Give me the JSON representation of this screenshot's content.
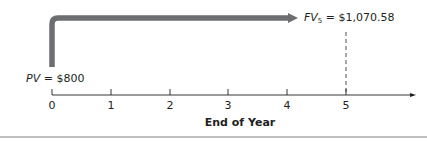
{
  "diagram": {
    "type": "timeline",
    "present_value": {
      "symbol": "PV",
      "equals": "=",
      "value": "$800"
    },
    "future_value": {
      "symbol": "FV",
      "subscript": "5",
      "equals": "=",
      "value": "$1,070.58"
    },
    "axis": {
      "ticks": [
        "0",
        "1",
        "2",
        "3",
        "4",
        "5"
      ],
      "title": "End of Year"
    },
    "colors": {
      "arrow": "#6d6e71",
      "axis": "#231f20",
      "text": "#231f20",
      "rule": "#808080"
    }
  }
}
